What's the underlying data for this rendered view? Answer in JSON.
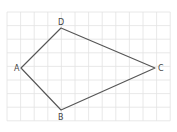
{
  "diagram": {
    "type": "quadrilateral-on-grid",
    "grid": {
      "x0": 7,
      "y0": 12,
      "cell": 13.6,
      "cols": 12,
      "rows": 8,
      "color": "#e2e2e2"
    },
    "stroke_color": "#555555",
    "vertices": [
      {
        "name": "A",
        "x": 21,
        "y": 68,
        "label_x": 14,
        "label_y": 71
      },
      {
        "name": "D",
        "x": 61,
        "y": 28,
        "label_x": 58,
        "label_y": 25
      },
      {
        "name": "C",
        "x": 155,
        "y": 68,
        "label_x": 158,
        "label_y": 71
      },
      {
        "name": "B",
        "x": 61,
        "y": 110,
        "label_x": 58,
        "label_y": 120
      }
    ],
    "edges": [
      [
        "A",
        "D"
      ],
      [
        "D",
        "C"
      ],
      [
        "C",
        "B"
      ],
      [
        "B",
        "A"
      ]
    ]
  }
}
